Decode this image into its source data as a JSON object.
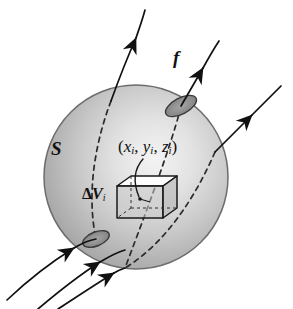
{
  "figure": {
    "background_color": "#ffffff",
    "width": 293,
    "height": 309
  },
  "labels": {
    "surface": "S",
    "flux_field": "f",
    "coordinates": {
      "open_paren": "(",
      "x": "x",
      "x_sub": "i",
      "comma1": ", ",
      "y": "y",
      "y_sub": "i",
      "comma2": ", ",
      "z": "z",
      "z_sub": "i",
      "close_paren": ")",
      "full_text": "(xi, yi, zi)"
    },
    "volume_element": {
      "delta": "Δ",
      "symbol": "V",
      "subscript": "i",
      "full_text": "ΔVi"
    }
  },
  "colors": {
    "ink": "#111111",
    "sphere_edge": "#6d6d6d",
    "sphere_shade_dark": "#9a9a9a",
    "sphere_shade_mid": "#bcbcbc",
    "sphere_shade_light": "#efefef",
    "patch_fill": "#8e8e8e",
    "patch_stroke": "#3a3a3a",
    "cube_top_fill": "#ffffff",
    "cube_stroke": "#1a1a1a",
    "dashed_curve": "#2b2b2b",
    "background": "#ffffff"
  },
  "geometry": {
    "sphere": {
      "center_x": 136,
      "center_y": 177,
      "radius": 92
    },
    "cube": {
      "center_x": 140,
      "center_y": 198,
      "width": 46,
      "height": 34,
      "depth": 14
    },
    "surface_patches": [
      {
        "name": "exit-patch-upper-right",
        "cx": 181,
        "cy": 106,
        "rx": 17,
        "ry": 8,
        "rotation": -28
      },
      {
        "name": "entry-patch-lower-left",
        "cx": 96,
        "cy": 239,
        "rx": 14,
        "ry": 7,
        "rotation": -22
      }
    ]
  },
  "flux_lines": [
    {
      "name": "flux-line-1",
      "description": "enters lower-left, exits top, arrowheads at bottom entry and top exit"
    },
    {
      "name": "flux-line-2",
      "description": "enters lower-left, exits upper-right through patch"
    },
    {
      "name": "flux-line-3",
      "description": "enters bottom, exits right side"
    }
  ],
  "annotations": {
    "leader_line": "curved pointer from coordinate label to cube center point"
  }
}
